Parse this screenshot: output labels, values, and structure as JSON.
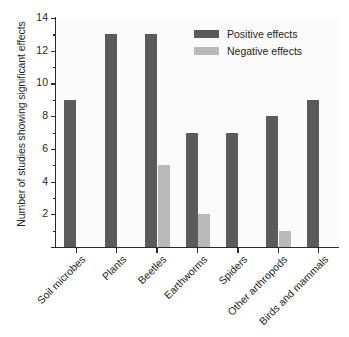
{
  "chart_data": {
    "type": "bar",
    "title": "",
    "subtitle": "",
    "xlabel": "",
    "ylabel": "Number of studies showing significant effects",
    "ylim": [
      0,
      14
    ],
    "ytick_step": 2,
    "yminor_tick_step": 1,
    "yticks": [
      0,
      2,
      4,
      6,
      8,
      10,
      12,
      14
    ],
    "ytick_labels": [
      "",
      "2",
      "4",
      "6",
      "8",
      "10",
      "12",
      "14"
    ],
    "grid": false,
    "legend_position": "top-right",
    "categories": [
      "Soil microbes",
      "Plants",
      "Beetles",
      "Earthworms",
      "Spiders",
      "Other arthropods",
      "Birds and mammals"
    ],
    "series": [
      {
        "name": "Positive effects",
        "color": "#5a5a5a",
        "values": [
          9,
          13,
          13,
          7,
          7,
          8,
          9
        ]
      },
      {
        "name": "Negative effects",
        "color": "#b9b9b9",
        "values": [
          0,
          0,
          5,
          2,
          0,
          1,
          0
        ]
      }
    ]
  },
  "legend": {
    "items": [
      {
        "label": "Positive effects",
        "color": "#5a5a5a"
      },
      {
        "label": "Negative effects",
        "color": "#b9b9b9"
      }
    ]
  },
  "colors": {
    "positive": "#5a5a5a",
    "negative": "#b9b9b9",
    "axis": "#2b2b2b",
    "plot_background": "#fafafa",
    "text": "#231f20"
  }
}
